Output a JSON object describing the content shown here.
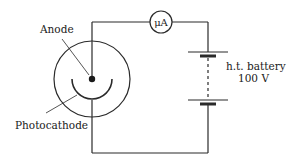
{
  "diagram": {
    "type": "circuit",
    "labels": {
      "anode": "Anode",
      "photocathode": "Photocathode",
      "battery_line1": "h.t. battery",
      "battery_line2": "100 V",
      "ammeter": "μA"
    },
    "components": [
      {
        "id": "photocell",
        "kind": "vacuum photocell",
        "parts": [
          "anode",
          "photocathode"
        ]
      },
      {
        "id": "ammeter",
        "kind": "microammeter",
        "symbol": "μA"
      },
      {
        "id": "battery",
        "kind": "h.t. battery",
        "voltage": "100 V"
      }
    ],
    "connections": [
      [
        "anode",
        "ammeter"
      ],
      [
        "ammeter",
        "battery"
      ],
      [
        "battery",
        "photocathode"
      ]
    ],
    "colors": {
      "line": "#2a2a2a",
      "text": "#1a1a1a",
      "background": "#ffffff"
    }
  }
}
